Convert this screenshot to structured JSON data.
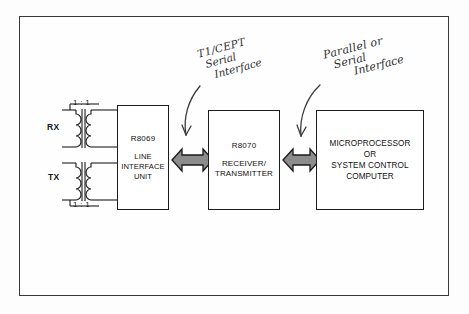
{
  "diagram": {
    "colors": {
      "ink": "#1d1d1d",
      "frame": "#3a3a3a",
      "arrow_fill": "#8c8c8c",
      "arrow_stroke": "#1a1a1a",
      "handwriting": "#2e2e2e",
      "background": "#fdfdfd"
    },
    "ports": [
      {
        "name": "rx",
        "label": "RX"
      },
      {
        "name": "tx",
        "label": "TX"
      }
    ],
    "transformers": [
      {
        "name": "rx-transformer",
        "ratio": "1 : 1",
        "ratio_position": "above",
        "turns": 3
      },
      {
        "name": "tx-transformer",
        "ratio": "1 : 1",
        "ratio_position": "below",
        "turns": 3
      }
    ],
    "blocks": [
      {
        "name": "line-interface-unit",
        "part_number": "R8069",
        "description": "LINE\nINTERFACE\nUNIT",
        "desc_line1": "LINE",
        "desc_line2": "INTERFACE",
        "desc_line3": "UNIT"
      },
      {
        "name": "receiver-transmitter",
        "part_number": "R8070",
        "desc_line1": "RECEIVER/",
        "desc_line2": "TRANSMITTER",
        "desc_line3": ""
      },
      {
        "name": "microprocessor",
        "part_number": "",
        "desc_line1": "MICROPROCESSOR",
        "desc_line2": "OR",
        "desc_line3": "SYSTEM CONTROL",
        "desc_line4": "COMPUTER"
      }
    ],
    "connectors": [
      {
        "name": "liu-to-rt-bus",
        "style": "double-headed-arrow"
      },
      {
        "name": "rt-to-mpu-bus",
        "style": "double-headed-arrow"
      }
    ],
    "annotations": [
      {
        "name": "annotation-serial-interface",
        "line1": "T1/CEPT",
        "line2": "Serial",
        "line3": "Interface",
        "points_to": "liu-to-rt-bus"
      },
      {
        "name": "annotation-parallel-serial",
        "line1": "Parallel or",
        "line2": "Serial",
        "line3": "Interface",
        "points_to": "rt-to-mpu-bus"
      }
    ]
  }
}
